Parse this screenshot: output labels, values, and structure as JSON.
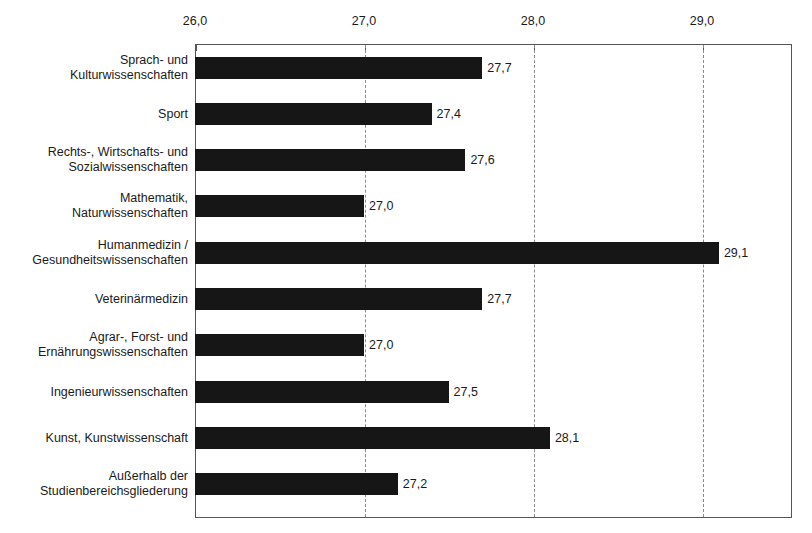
{
  "top_fragment": "",
  "chart_data": {
    "type": "bar",
    "orientation": "horizontal",
    "title": "",
    "xlabel": "",
    "ylabel": "",
    "xlim": [
      26.0,
      29.533
    ],
    "axis_min": 26.0,
    "grid": true,
    "legend": "none",
    "decimal_separator": ",",
    "bar_color": "#161616",
    "gridline_color": "#8a8a8a",
    "frame_color": "#555555",
    "tick_labels": [
      "26,0",
      "27,0",
      "28,0",
      "29,0"
    ],
    "tick_values": [
      26.0,
      27.0,
      28.0,
      29.0
    ],
    "categories": [
      "Sprach- und\nKulturwissenschaften",
      "Sport",
      "Rechts-, Wirtschafts- und\nSozialwissenschaften",
      "Mathematik,\nNaturwissenschaften",
      "Humanmedizin /\nGesundheitswissenschaften",
      "Veterinärmedizin",
      "Agrar-, Forst- und\nErnährungswissenschaften",
      "Ingenieurwissenschaften",
      "Kunst, Kunstwissenschaft",
      "Außerhalb der\nStudienbereichsgliederung"
    ],
    "values": [
      27.7,
      27.4,
      27.6,
      27.0,
      29.1,
      27.7,
      27.0,
      27.5,
      28.1,
      27.2
    ],
    "value_labels": [
      "27,7",
      "27,4",
      "27,6",
      "27,0",
      "29,1",
      "27,7",
      "27,0",
      "27,5",
      "28,1",
      "27,2"
    ]
  }
}
